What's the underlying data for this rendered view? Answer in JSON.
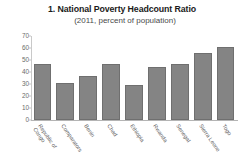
{
  "chart_data": {
    "type": "bar",
    "title": "1. National Poverty Headcount Ratio",
    "subtitle": "(2011, percent of population)",
    "xlabel": "",
    "ylabel": "",
    "ylim": [
      0,
      70
    ],
    "yticks": [
      0,
      10,
      20,
      30,
      40,
      50,
      60,
      70
    ],
    "grid": false,
    "legend": "none",
    "bar_color": "#848484",
    "categories": [
      "Republic of Congo",
      "Comparators",
      "Benin",
      "Chad",
      "Ethiopia",
      "Rwanda",
      "Senegal",
      "Sierra Leone",
      "Togo"
    ],
    "values": [
      46.5,
      31.0,
      36.5,
      46.5,
      29.5,
      44.5,
      46.5,
      55.5,
      61.0
    ]
  },
  "ytick_labels": [
    "70",
    "60",
    "50",
    "40",
    "30",
    "20",
    "10",
    "0"
  ],
  "category_lines": [
    [
      "Republic of",
      "Congo"
    ],
    [
      "Comparators",
      ""
    ],
    [
      "Benin",
      ""
    ],
    [
      "Chad",
      ""
    ],
    [
      "Ethiopia",
      ""
    ],
    [
      "Rwanda",
      ""
    ],
    [
      "Senegal",
      ""
    ],
    [
      "Sierra Leone",
      ""
    ],
    [
      "Togo",
      ""
    ]
  ]
}
